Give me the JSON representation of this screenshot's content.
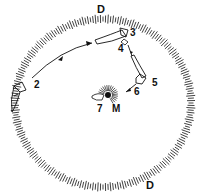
{
  "diagram": {
    "labels": {
      "d_top": "D",
      "d_bottom": "D",
      "m": "M",
      "p2": "2",
      "p3": "3",
      "p4": "4",
      "p5": "5",
      "p6": "6",
      "p7": "7"
    },
    "colors": {
      "ink": "#111111",
      "background": "#ffffff"
    }
  }
}
